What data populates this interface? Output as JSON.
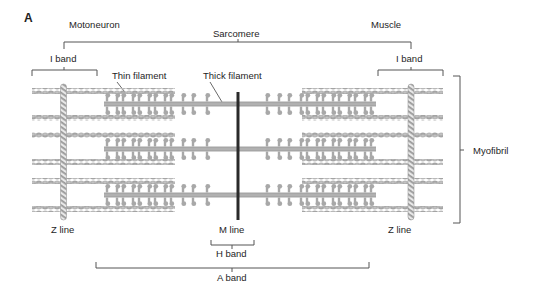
{
  "figure": {
    "panel_label": "A",
    "labels": {
      "motoneuron": "Motoneuron",
      "muscle": "Muscle",
      "sarcomere": "Sarcomere",
      "i_band_left": "I band",
      "i_band_right": "I band",
      "thin_filament": "Thin filament",
      "thick_filament": "Thick filament",
      "myofibril": "Myofibril",
      "z_line_left": "Z line",
      "z_line_right": "Z line",
      "m_line": "M line",
      "h_band": "H band",
      "a_band": "A band"
    },
    "colors": {
      "filament": "#a9a9a9",
      "m_line": "#2a2a2a",
      "bracket": "#555555",
      "text": "#1e1e1e"
    }
  }
}
